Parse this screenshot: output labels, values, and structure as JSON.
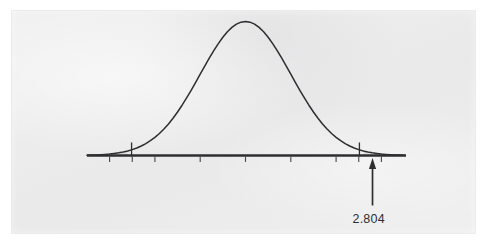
{
  "figure": {
    "background_color": "#ececed",
    "page_color": "#ffffff",
    "ink_color": "#2e2e30",
    "annotation_label": "2.804"
  },
  "chart_data": {
    "type": "line",
    "title": "",
    "subtitle": "",
    "xlabel": "",
    "ylabel": "",
    "grid": false,
    "legend": null,
    "curve": "standard normal density",
    "distribution": {
      "name": "normal",
      "mean": 0,
      "sd": 1
    },
    "xlim": [
      -3.5,
      3.5
    ],
    "ylim": [
      0,
      0.42
    ],
    "axis_tick_values": [
      -3,
      -2.5,
      -2,
      -1,
      0,
      1,
      2,
      2.5,
      3
    ],
    "axis_tick_labels": [
      "",
      "",
      "",
      "",
      "",
      "",
      "",
      "",
      ""
    ],
    "markers": [
      {
        "name": "left-tail-boundary",
        "x": -2.515,
        "kind": "vertical-line"
      },
      {
        "name": "right-tail-boundary",
        "x": 2.515,
        "kind": "vertical-line"
      }
    ],
    "annotations": [
      {
        "name": "test-statistic-arrow",
        "text": "2.804",
        "x": 2.804,
        "y": 0,
        "arrow": "up"
      }
    ],
    "x": [
      -3.5,
      -3.4,
      -3.3,
      -3.2,
      -3.1,
      -3.0,
      -2.9,
      -2.8,
      -2.7,
      -2.6,
      -2.5,
      -2.4,
      -2.3,
      -2.2,
      -2.1,
      -2.0,
      -1.9,
      -1.8,
      -1.7,
      -1.6,
      -1.5,
      -1.4,
      -1.3,
      -1.2,
      -1.1,
      -1.0,
      -0.9,
      -0.8,
      -0.7,
      -0.6,
      -0.5,
      -0.4,
      -0.3,
      -0.2,
      -0.1,
      0.0,
      0.1,
      0.2,
      0.3,
      0.4,
      0.5,
      0.6,
      0.7,
      0.8,
      0.9,
      1.0,
      1.1,
      1.2,
      1.3,
      1.4,
      1.5,
      1.6,
      1.7,
      1.8,
      1.9,
      2.0,
      2.1,
      2.2,
      2.3,
      2.4,
      2.5,
      2.6,
      2.7,
      2.8,
      2.9,
      3.0,
      3.1,
      3.2,
      3.3,
      3.4,
      3.5
    ],
    "y": [
      0.0009,
      0.0012,
      0.0017,
      0.0024,
      0.0033,
      0.0044,
      0.006,
      0.0079,
      0.0104,
      0.0136,
      0.0175,
      0.0224,
      0.0283,
      0.0355,
      0.044,
      0.054,
      0.0656,
      0.079,
      0.094,
      0.1109,
      0.1295,
      0.1497,
      0.1714,
      0.1942,
      0.2179,
      0.242,
      0.2661,
      0.2897,
      0.3123,
      0.3332,
      0.3521,
      0.3683,
      0.3814,
      0.391,
      0.397,
      0.3989,
      0.397,
      0.391,
      0.3814,
      0.3683,
      0.3521,
      0.3332,
      0.3123,
      0.2897,
      0.2661,
      0.242,
      0.2179,
      0.1942,
      0.1714,
      0.1497,
      0.1295,
      0.1109,
      0.094,
      0.079,
      0.0656,
      0.054,
      0.044,
      0.0355,
      0.0283,
      0.0224,
      0.0175,
      0.0136,
      0.0104,
      0.0079,
      0.006,
      0.0044,
      0.0033,
      0.0024,
      0.0017,
      0.0012,
      0.0009
    ]
  }
}
